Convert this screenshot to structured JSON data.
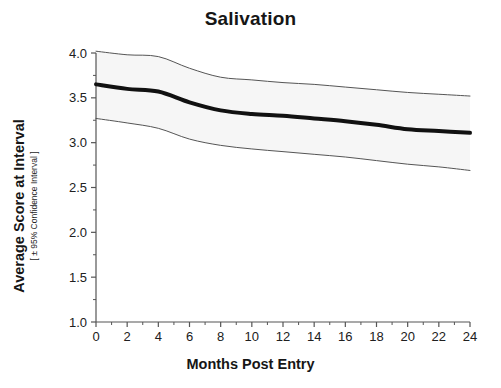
{
  "chart_data": {
    "type": "line",
    "title": "Salivation",
    "xlabel": "Months Post Entry",
    "ylabel": "Average Score at Interval",
    "ylabel_sub": "[ ± 95% Confidence Interval ]",
    "x": [
      0,
      2,
      4,
      6,
      8,
      10,
      12,
      14,
      16,
      18,
      20,
      22,
      24
    ],
    "xlim": [
      0,
      24
    ],
    "ylim": [
      1.0,
      4.0
    ],
    "xticks": [
      "0",
      "2",
      "4",
      "6",
      "8",
      "10",
      "12",
      "14",
      "16",
      "18",
      "20",
      "22",
      "24"
    ],
    "yticks": [
      "1.0",
      "1.5",
      "2.0",
      "2.5",
      "3.0",
      "3.5",
      "4.0"
    ],
    "xtick_values": [
      0,
      2,
      4,
      6,
      8,
      10,
      12,
      14,
      16,
      18,
      20,
      22,
      24
    ],
    "ytick_values": [
      1.0,
      1.5,
      2.0,
      2.5,
      3.0,
      3.5,
      4.0
    ],
    "grid": false,
    "legend": "none",
    "series": [
      {
        "name": "Average Score",
        "role": "mean",
        "color": "#111111",
        "line_width": 4,
        "values": [
          3.65,
          3.6,
          3.57,
          3.45,
          3.36,
          3.32,
          3.3,
          3.27,
          3.24,
          3.2,
          3.15,
          3.13,
          3.11
        ]
      },
      {
        "name": "Upper 95% Confidence Limit",
        "role": "ci-upper",
        "color": "#555555",
        "line_width": 1,
        "values": [
          4.02,
          3.98,
          3.96,
          3.83,
          3.73,
          3.7,
          3.67,
          3.65,
          3.62,
          3.59,
          3.56,
          3.54,
          3.52
        ]
      },
      {
        "name": "Lower 95% Confidence Limit",
        "role": "ci-lower",
        "color": "#555555",
        "line_width": 1,
        "values": [
          3.27,
          3.22,
          3.16,
          3.04,
          2.97,
          2.93,
          2.9,
          2.87,
          2.84,
          2.8,
          2.76,
          2.73,
          2.69
        ]
      }
    ],
    "band_fill": "#f6f6f6",
    "axis_color": "#555555",
    "background": "#ffffff"
  },
  "figure": {
    "title": "Salivation",
    "xlabel": "Months Post Entry",
    "ylabel_main": "Average Score at Interval",
    "ylabel_sub": "[ ± 95% Confidence Interval ]"
  }
}
